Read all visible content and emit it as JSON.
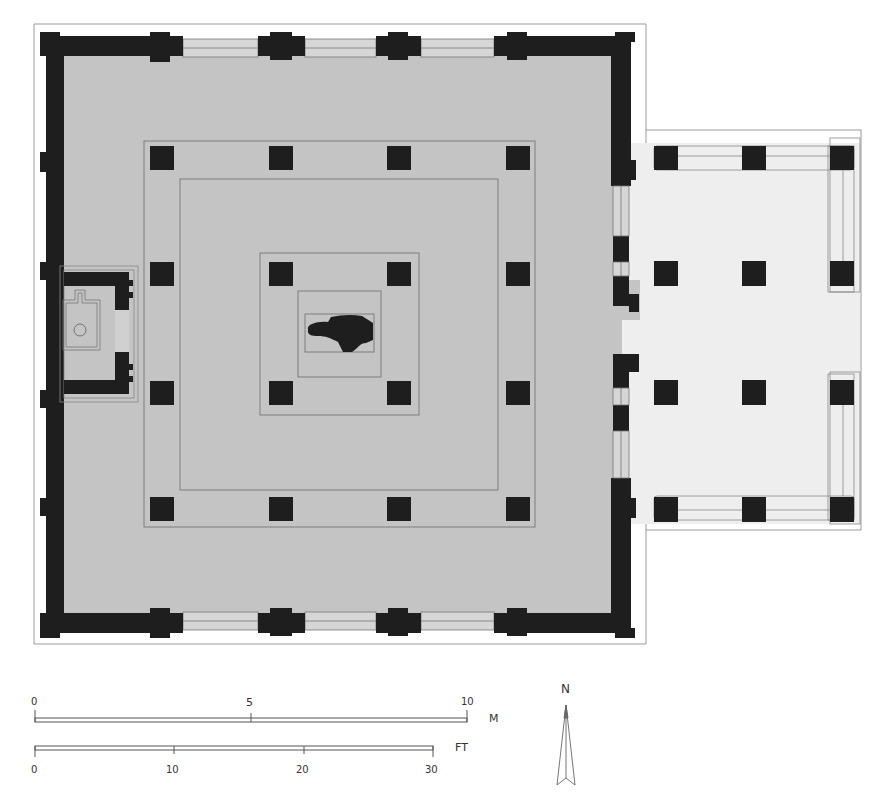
{
  "plan": {
    "title": "Temple floor plan",
    "colors": {
      "wall": "#1e1e1e",
      "hall_floor": "#c4c4c4",
      "porch_floor": "#eeeeee",
      "outline": "#888888",
      "background": "#ffffff"
    },
    "regions": [
      "main-hall",
      "east-porch",
      "west-shrine",
      "outer-colonnade",
      "inner-ambulatory",
      "central-sanctum",
      "central-idol"
    ]
  },
  "scale_bars": {
    "metric": {
      "unit": "M",
      "ticks": [
        "0",
        "5",
        "10"
      ]
    },
    "imperial": {
      "unit": "FT",
      "ticks": [
        "0",
        "10",
        "20",
        "30"
      ]
    }
  },
  "north_arrow": {
    "label": "N"
  }
}
